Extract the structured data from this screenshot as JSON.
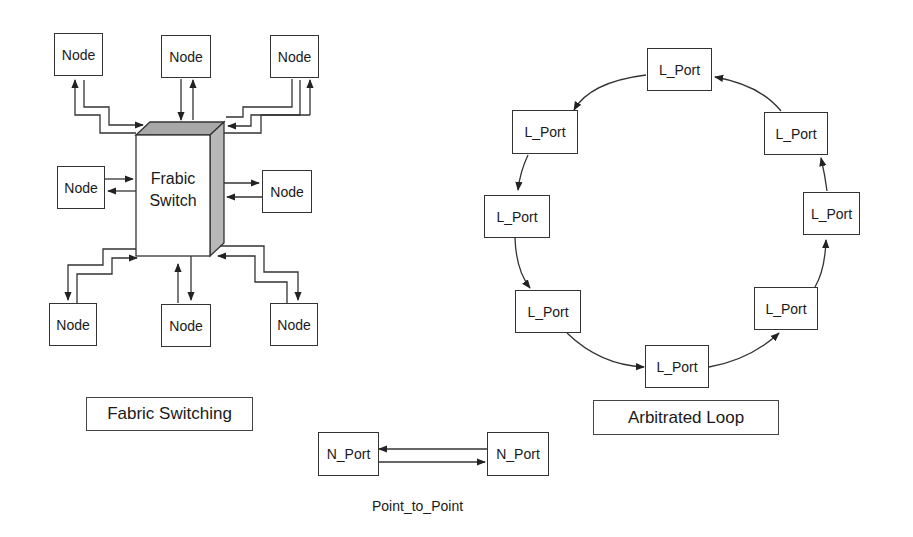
{
  "fabric": {
    "title": "Fabric Switching",
    "switch_line1": "Frabic",
    "switch_line2": "Switch",
    "nodes": [
      "Node",
      "Node",
      "Node",
      "Node",
      "Node",
      "Node",
      "Node",
      "Node"
    ]
  },
  "loop": {
    "title": "Arbitrated Loop",
    "ports": [
      "L_Port",
      "L_Port",
      "L_Port",
      "L_Port",
      "L_Port",
      "L_Port",
      "L_Port",
      "L_Port"
    ]
  },
  "p2p": {
    "title": "Point_to_Point",
    "ports": [
      "N_Port",
      "N_Port"
    ]
  },
  "colors": {
    "line": "#333333",
    "switch_top": "#a8a8a8",
    "switch_side": "#b8b8b8"
  }
}
